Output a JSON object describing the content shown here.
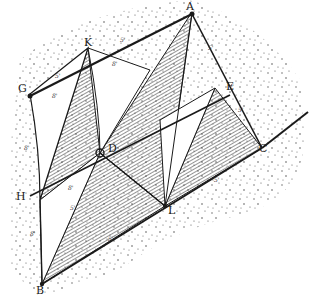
{
  "diagram": {
    "type": "engraving-line-drawing",
    "colors": {
      "ink": "#1a1a1a",
      "paper": "#ffffff",
      "stipple": "#555555",
      "hatch": "#3a3a3a"
    },
    "points": {
      "A": {
        "label": "A",
        "x": 192,
        "y": 12
      },
      "K": {
        "label": "K",
        "x": 88,
        "y": 48
      },
      "G": {
        "label": "G",
        "x": 30,
        "y": 94
      },
      "E": {
        "label": "E",
        "x": 215,
        "y": 88
      },
      "D": {
        "label": "D",
        "x": 100,
        "y": 153
      },
      "C": {
        "label": "C",
        "x": 262,
        "y": 148
      },
      "H": {
        "label": "H",
        "x": 30,
        "y": 196
      },
      "L": {
        "label": "L",
        "x": 165,
        "y": 206
      },
      "B": {
        "label": "B",
        "x": 42,
        "y": 284
      }
    },
    "dimension_labels": [
      "5'",
      "5'",
      "8'",
      "8'",
      "5'",
      "5'",
      "8'",
      "5'",
      "8'",
      "8'",
      "5'",
      "5'"
    ]
  }
}
